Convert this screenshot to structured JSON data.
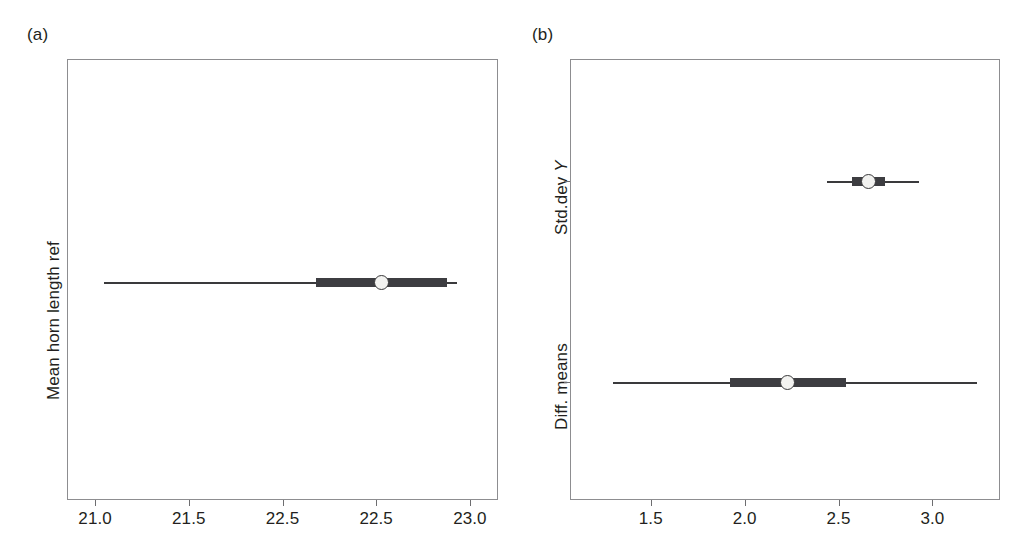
{
  "figure": {
    "panels": [
      {
        "letter": "(a)",
        "ylabel": "Mean horn length ref",
        "xticks": [
          "21.0",
          "21.5",
          "22.5",
          "22.5",
          "23.0"
        ],
        "xtick_values": [
          21.0,
          21.5,
          22.0,
          22.5,
          23.0
        ],
        "xlim": [
          20.85,
          23.15
        ],
        "rows": [
          {
            "name": "Mean horn length ref",
            "estimate": 22.53,
            "inner_low": 22.18,
            "inner_high": 22.88,
            "outer_low": 21.05,
            "outer_high": 22.93
          }
        ]
      },
      {
        "letter": "(b)",
        "ylabels": [
          "Std.dev Y",
          "Diff. means"
        ],
        "ylabel_std_prefix": "Std.dev ",
        "ylabel_std_italic": "Y",
        "ylabel_diff": "Diff. means",
        "xticks": [
          "1.5",
          "2.0",
          "2.5",
          "3.0"
        ],
        "xtick_values": [
          1.5,
          2.0,
          2.5,
          3.0
        ],
        "xlim": [
          1.07,
          3.36
        ],
        "rows": [
          {
            "name": "Std.dev Y",
            "estimate": 2.66,
            "inner_low": 2.57,
            "inner_high": 2.75,
            "outer_low": 2.44,
            "outer_high": 2.93
          },
          {
            "name": "Diff. means",
            "estimate": 2.23,
            "inner_low": 1.92,
            "inner_high": 2.54,
            "outer_low": 1.3,
            "outer_high": 3.24
          }
        ]
      }
    ]
  },
  "chart_data": {
    "type": "scatter",
    "title": "",
    "subtitle": "",
    "grid": false,
    "legend": null,
    "panels": [
      {
        "label": "(a)",
        "ylabel": "Mean horn length ref",
        "xlabel": "",
        "xlim": [
          20.85,
          23.15
        ],
        "xticks": [
          21.0,
          21.5,
          22.0,
          22.5,
          23.0
        ],
        "xticklabels": [
          "21.0",
          "21.5",
          "22.5",
          "22.5",
          "23.0"
        ],
        "series": [
          {
            "name": "Mean horn length ref",
            "estimate": 22.53,
            "inner_interval": [
              22.18,
              22.88
            ],
            "outer_interval": [
              21.05,
              22.93
            ]
          }
        ]
      },
      {
        "label": "(b)",
        "ylabel": "",
        "xlabel": "",
        "xlim": [
          1.07,
          3.36
        ],
        "xticks": [
          1.5,
          2.0,
          2.5,
          3.0
        ],
        "xticklabels": [
          "1.5",
          "2.0",
          "2.5",
          "3.0"
        ],
        "yticklabels": [
          "Std.dev Y",
          "Diff. means"
        ],
        "series": [
          {
            "name": "Std.dev Y",
            "estimate": 2.66,
            "inner_interval": [
              2.57,
              2.75
            ],
            "outer_interval": [
              2.44,
              2.93
            ]
          },
          {
            "name": "Diff. means",
            "estimate": 2.23,
            "inner_interval": [
              1.92,
              2.54
            ],
            "outer_interval": [
              1.3,
              3.24
            ]
          }
        ]
      }
    ]
  },
  "style": {
    "background": "#ffffff",
    "frame_color": "#8d8d90",
    "text_color": "#231f20",
    "marker_line_color": "#3a3a3c",
    "marker_bar_color": "#3d3d41",
    "marker_fill_color": "#f2f2f0"
  }
}
